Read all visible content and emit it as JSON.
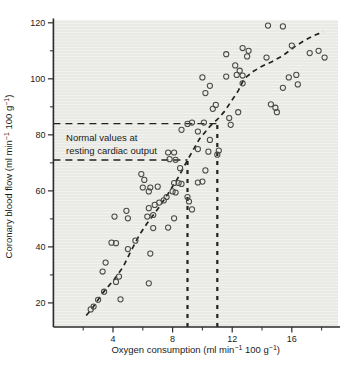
{
  "figure": {
    "width": 342,
    "height": 366,
    "background": "#ffffff"
  },
  "chart_data": {
    "type": "scatter",
    "title": "",
    "xlabel": "Oxygen consumption (ml min^−1^ 100 g^−1^)",
    "ylabel": "Coronary blood flow (ml min^−1^ 100 g^−1^)",
    "xlim": [
      0,
      19.1
    ],
    "ylim": [
      11.4,
      121.0
    ],
    "x_major_ticks": [
      4,
      8,
      12,
      16
    ],
    "x_minor_ticks": [
      2,
      6,
      10,
      14,
      18
    ],
    "y_major_ticks": [
      20,
      40,
      60,
      80,
      100,
      120
    ],
    "y_minor_ticks": [
      30,
      50,
      70,
      90,
      110
    ],
    "grid": false,
    "legend": null,
    "marker": "open-circle",
    "points": [
      [
        2.5,
        17.7
      ],
      [
        2.7,
        18.7
      ],
      [
        3.0,
        21.1
      ],
      [
        4.5,
        21.3
      ],
      [
        3.4,
        24.0
      ],
      [
        4.2,
        27.5
      ],
      [
        4.4,
        29.4
      ],
      [
        3.3,
        31.2
      ],
      [
        3.5,
        34.4
      ],
      [
        5.0,
        39.2
      ],
      [
        3.9,
        41.5
      ],
      [
        4.2,
        41.3
      ],
      [
        5.5,
        42.2
      ],
      [
        6.5,
        37.6
      ],
      [
        6.4,
        27.0
      ],
      [
        4.1,
        50.8
      ],
      [
        4.9,
        52.9
      ],
      [
        5.0,
        50.2
      ],
      [
        6.4,
        53.8
      ],
      [
        5.9,
        66.0
      ],
      [
        6.1,
        63.9
      ],
      [
        6.0,
        61.2
      ],
      [
        6.5,
        61.2
      ],
      [
        6.7,
        46.7
      ],
      [
        7.7,
        46.9
      ],
      [
        6.3,
        50.8
      ],
      [
        6.7,
        51.4
      ],
      [
        8.1,
        50.2
      ],
      [
        6.8,
        55.0
      ],
      [
        7.1,
        55.8
      ],
      [
        7.4,
        56.6
      ],
      [
        7.6,
        57.8
      ],
      [
        9.0,
        57.8
      ],
      [
        9.1,
        56.2
      ],
      [
        9.3,
        53.4
      ],
      [
        6.4,
        59.8
      ],
      [
        7.0,
        61.5
      ],
      [
        8.0,
        59.8
      ],
      [
        8.2,
        59.4
      ],
      [
        8.1,
        62.8
      ],
      [
        8.4,
        62.8
      ],
      [
        8.6,
        62.5
      ],
      [
        9.7,
        63.0
      ],
      [
        10.0,
        63.3
      ],
      [
        8.5,
        68.1
      ],
      [
        10.2,
        67.3
      ],
      [
        7.8,
        71.3
      ],
      [
        8.2,
        71.1
      ],
      [
        7.7,
        73.7
      ],
      [
        8.1,
        73.7
      ],
      [
        9.7,
        74.9
      ],
      [
        10.4,
        74.0
      ],
      [
        11.0,
        72.9
      ],
      [
        11.1,
        74.4
      ],
      [
        10.5,
        78.2
      ],
      [
        8.6,
        81.8
      ],
      [
        9.7,
        81.2
      ],
      [
        9.0,
        83.9
      ],
      [
        9.3,
        84.4
      ],
      [
        10.1,
        84.4
      ],
      [
        11.9,
        83.6
      ],
      [
        11.8,
        86.0
      ],
      [
        12.4,
        88.1
      ],
      [
        10.7,
        89.3
      ],
      [
        10.9,
        90.7
      ],
      [
        10.2,
        94.9
      ],
      [
        10.5,
        97.5
      ],
      [
        10.0,
        100.5
      ],
      [
        11.6,
        100.8
      ],
      [
        14.6,
        90.9
      ],
      [
        14.9,
        89.7
      ],
      [
        15.0,
        88.1
      ],
      [
        15.4,
        96.8
      ],
      [
        16.4,
        98.0
      ],
      [
        12.3,
        101.4
      ],
      [
        12.7,
        101.2
      ],
      [
        12.7,
        98.4
      ],
      [
        12.5,
        102.9
      ],
      [
        12.2,
        104.8
      ],
      [
        11.6,
        108.8
      ],
      [
        12.7,
        111.0
      ],
      [
        13.1,
        110.0
      ],
      [
        13.0,
        108.0
      ],
      [
        14.3,
        107.6
      ],
      [
        15.8,
        100.5
      ],
      [
        16.3,
        101.4
      ],
      [
        16.0,
        111.9
      ],
      [
        17.2,
        109.2
      ],
      [
        17.8,
        110.0
      ],
      [
        18.2,
        107.6
      ],
      [
        14.4,
        119.0
      ],
      [
        15.4,
        118.7
      ]
    ],
    "trend_curve": {
      "style": "dashed",
      "points": [
        [
          2.2,
          15.5
        ],
        [
          2.6,
          18.0
        ],
        [
          3.3,
          23.5
        ],
        [
          4.1,
          28.5
        ],
        [
          4.7,
          33.0
        ],
        [
          5.2,
          38.5
        ],
        [
          5.8,
          44.5
        ],
        [
          6.3,
          48.5
        ],
        [
          7.0,
          53.5
        ],
        [
          7.7,
          59.0
        ],
        [
          8.4,
          65.0
        ],
        [
          9.0,
          71.0
        ],
        [
          9.8,
          78.5
        ],
        [
          10.5,
          83.0
        ],
        [
          11.1,
          86.0
        ],
        [
          11.5,
          88.5
        ],
        [
          11.9,
          91.7
        ],
        [
          12.4,
          95.7
        ],
        [
          12.8,
          100.0
        ],
        [
          13.4,
          102.6
        ],
        [
          14.0,
          104.5
        ],
        [
          14.7,
          106.2
        ],
        [
          15.4,
          108.3
        ],
        [
          16.2,
          111.5
        ],
        [
          16.8,
          113.5
        ],
        [
          17.4,
          115.3
        ],
        [
          18.1,
          116.8
        ]
      ]
    },
    "reference_lines": [
      {
        "orientation": "horizontal",
        "value": 84,
        "from_x": 0,
        "to_x": 11
      },
      {
        "orientation": "horizontal",
        "value": 71,
        "from_x": 0,
        "to_x": 9
      },
      {
        "orientation": "vertical",
        "value": 9,
        "from_y": 11.4,
        "to_y": 71
      },
      {
        "orientation": "vertical",
        "value": 11,
        "from_y": 11.4,
        "to_y": 84
      }
    ],
    "annotation": {
      "lines": [
        "Normal values at",
        "resting cardiac output"
      ],
      "x": 0.85,
      "y": 77.8
    },
    "colors": {
      "panel": "#e9eae5",
      "panel_stripe": "#f3f4ef",
      "axis": "#2b2b2b",
      "point": "#4a4a4a",
      "dash": "#222222",
      "text": "#1a1a1a",
      "background": "#ffffff"
    }
  }
}
